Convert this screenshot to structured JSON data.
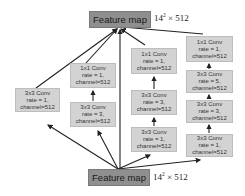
{
  "feature_map_top": {
    "label": "Feature map",
    "dim_base": "14",
    "dim_exp": "2",
    "dim_rest": " × 512"
  },
  "feature_map_bottom": {
    "label": "Feature map",
    "dim_base": "14",
    "dim_exp": "2",
    "dim_rest": " × 512"
  },
  "branches": [
    {
      "name": "branch-1",
      "blocks": [
        {
          "l1": "3x3 Conv",
          "l2": "rate = 1,",
          "l3": "channel=512"
        }
      ]
    },
    {
      "name": "branch-2",
      "blocks": [
        {
          "l1": "1x1 Conv",
          "l2": "rate = 1,",
          "l3": "channel=512"
        },
        {
          "l1": "3x3 Conv",
          "l2": "rate = 3,",
          "l3": "channel=512"
        }
      ]
    },
    {
      "name": "branch-3",
      "blocks": [
        {
          "l1": "1x1 Conv",
          "l2": "rate = 1,",
          "l3": "channel=512"
        },
        {
          "l1": "3x3 Conv",
          "l2": "rate = 3,",
          "l3": "channel=512"
        },
        {
          "l1": "3x3 Conv",
          "l2": "rate = 1,",
          "l3": "channel=512"
        }
      ]
    },
    {
      "name": "branch-4",
      "blocks": [
        {
          "l1": "1x1 Conv",
          "l2": "rate = 1,",
          "l3": "channel=512"
        },
        {
          "l1": "3x3 Conv",
          "l2": "rate = 5,",
          "l3": "channel=512"
        },
        {
          "l1": "3x3 Conv",
          "l2": "rate = 3,",
          "l3": "channel=512"
        },
        {
          "l1": "3x3 Conv",
          "l2": "rate = 1,",
          "l3": "channel=512"
        }
      ]
    }
  ]
}
